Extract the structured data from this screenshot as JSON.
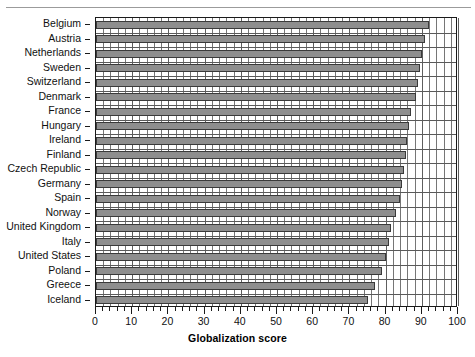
{
  "chart_data": {
    "type": "bar",
    "orientation": "horizontal",
    "title": "",
    "xlabel": "Globalization score",
    "ylabel": "",
    "xlim": [
      0,
      100
    ],
    "xticks": [
      0,
      10,
      20,
      30,
      40,
      50,
      60,
      70,
      80,
      90,
      100
    ],
    "xtick_labels": [
      "0",
      "10",
      "20",
      "30",
      "40",
      "50",
      "60",
      "70",
      "80",
      "90",
      "100"
    ],
    "minor_tick_step": 2,
    "grid": "vertical-minor-and-major",
    "legend": "none",
    "bar_fill_color": "#8e8e8e",
    "bar_edge_color": "#3a3a3a",
    "categories": [
      "Belgium",
      "Austria",
      "Netherlands",
      "Sweden",
      "Switzerland",
      "Denmark",
      "France",
      "Hungary",
      "Ireland",
      "Finland",
      "Czech Republic",
      "Germany",
      "Spain",
      "Norway",
      "United Kingdom",
      "Italy",
      "United States",
      "Poland",
      "Greece",
      "Iceland"
    ],
    "values": [
      92,
      91,
      90,
      89.5,
      89,
      88.5,
      87,
      86.5,
      86,
      85.5,
      85,
      84.5,
      84,
      83,
      81.5,
      81,
      80,
      79,
      77,
      75
    ]
  },
  "axis": {
    "x_title": "Globalization score"
  }
}
